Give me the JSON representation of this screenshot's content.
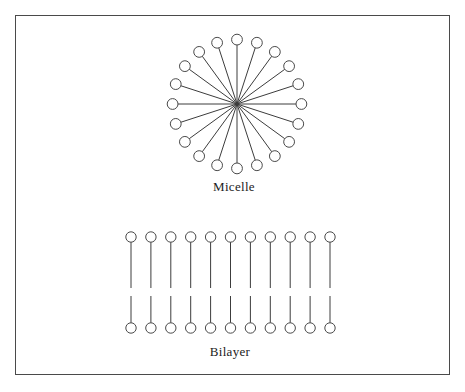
{
  "figure": {
    "background_color": "#ffffff",
    "frame": {
      "stroke_color": "#4a4a4a",
      "stroke_width": 1,
      "x": 15,
      "y": 15,
      "width": 435,
      "height": 360
    },
    "style": {
      "line_color": "#3c3c3c",
      "circle_stroke": "#4a4a4a",
      "circle_fill": "none",
      "line_width": 1,
      "head_radius": 5.2
    }
  },
  "structures": [
    {
      "name": "micelle",
      "label": "Micelle",
      "label_x": 234,
      "label_y": 187,
      "center_x": 237,
      "center_y": 104,
      "tail_length": 59,
      "head_radius": 5.4,
      "spoke_count": 20,
      "angle_step_degrees": 18,
      "start_angle_degrees": -90
    },
    {
      "name": "bilayer",
      "label": "Bilayer",
      "label_x": 230,
      "label_y": 352,
      "column_count": 11,
      "first_column_x": 131,
      "column_spacing": 19.9,
      "upper_head_y": 237,
      "upper_tail_end_y": 288,
      "lower_tail_start_y": 296,
      "lower_head_y": 328,
      "head_radius": 5.2
    }
  ]
}
